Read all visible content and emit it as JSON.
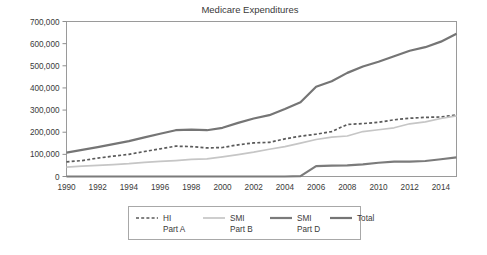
{
  "chart_data": {
    "type": "line",
    "title": "Medicare Expenditures",
    "xlabel": "",
    "ylabel": "",
    "grid": false,
    "legend_position": "bottom",
    "x": [
      1990,
      1991,
      1992,
      1993,
      1994,
      1995,
      1996,
      1997,
      1998,
      1999,
      2000,
      2001,
      2002,
      2003,
      2004,
      2005,
      2006,
      2007,
      2008,
      2009,
      2010,
      2011,
      2012,
      2013,
      2014,
      2015
    ],
    "xlim": [
      1990,
      2015
    ],
    "ylim": [
      0,
      700000
    ],
    "xticks": [
      1990,
      1992,
      1994,
      1996,
      1998,
      2000,
      2002,
      2004,
      2006,
      2008,
      2010,
      2012,
      2014
    ],
    "xtick_labels": [
      "1990",
      "1992",
      "1994",
      "1996",
      "1998",
      "2000",
      "2002",
      "2004",
      "2006",
      "2008",
      "2010",
      "2012",
      "2014"
    ],
    "yticks": [
      0,
      100000,
      200000,
      300000,
      400000,
      500000,
      600000,
      700000
    ],
    "ytick_labels": [
      "0",
      "100,000",
      "200,000",
      "300,000",
      "400,000",
      "500,000",
      "600,000",
      "700,000"
    ],
    "series": [
      {
        "name": "HI\nPart A",
        "legend_line1": "HI",
        "legend_line2": "Part A",
        "color": "#5a5a5a",
        "width": 1.7,
        "dash": "3,2.2",
        "values": [
          66000,
          72000,
          83000,
          92000,
          100000,
          113000,
          125000,
          137000,
          135000,
          129000,
          131000,
          143000,
          152000,
          154000,
          170000,
          182000,
          191000,
          203000,
          235000,
          239000,
          245000,
          256000,
          263000,
          267000,
          269000,
          278000
        ]
      },
      {
        "name": "SMI\nPart B",
        "legend_line1": "SMI",
        "legend_line2": "Part B",
        "color": "#c6c6c6",
        "width": 1.7,
        "dash": "",
        "values": [
          42000,
          47000,
          50000,
          54000,
          58000,
          64000,
          68000,
          72000,
          77000,
          80000,
          89000,
          99000,
          110000,
          123000,
          135000,
          151000,
          167000,
          178000,
          183000,
          203000,
          211000,
          220000,
          238000,
          247000,
          262000,
          274000
        ]
      },
      {
        "name": "SMI\nPart D",
        "legend_line1": "SMI",
        "legend_line2": "Part D",
        "color": "#7b7b7b",
        "width": 2.2,
        "dash": "",
        "values": [
          0,
          0,
          0,
          0,
          0,
          0,
          0,
          0,
          0,
          0,
          0,
          0,
          0,
          0,
          0,
          2000,
          47000,
          49000,
          50000,
          55000,
          62000,
          67000,
          67000,
          70000,
          78000,
          86000
        ]
      },
      {
        "name": "Total",
        "legend_line1": "Total",
        "legend_line2": "",
        "color": "#757575",
        "width": 2.2,
        "dash": "",
        "values": [
          108000,
          120000,
          133000,
          146000,
          160000,
          177000,
          193000,
          209000,
          212000,
          209000,
          220000,
          242000,
          262000,
          277000,
          305000,
          335000,
          405000,
          430000,
          468000,
          497000,
          518000,
          543000,
          568000,
          584000,
          609000,
          645000
        ]
      }
    ]
  },
  "axes": {
    "title": "Medicare Expenditures"
  }
}
